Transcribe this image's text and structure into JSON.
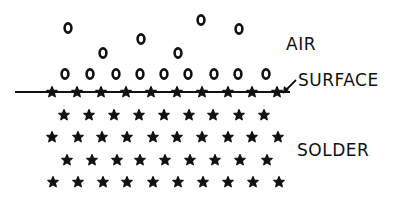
{
  "diagram": {
    "labels": {
      "air": "AIR",
      "surface": "SURFACE",
      "solder": "SOLDER"
    },
    "colors": {
      "ink": "#111111",
      "background": "#ffffff"
    },
    "symbols": {
      "air_molecule": "circle-o",
      "solder_atom": "star"
    },
    "air_scattered": [
      [
        68,
        28
      ],
      [
        103,
        53
      ],
      [
        141,
        39
      ],
      [
        178,
        53
      ],
      [
        201,
        20
      ],
      [
        239,
        29
      ]
    ],
    "air_row": {
      "y": 74,
      "x": [
        65,
        90,
        116,
        140,
        164,
        188,
        214,
        238,
        266
      ]
    },
    "surface_line": {
      "y": 92,
      "x1": 15,
      "x2": 290
    },
    "surface_stars": {
      "y": 92,
      "x": [
        52,
        77,
        101,
        126,
        151,
        177,
        202,
        228,
        252,
        277
      ]
    },
    "solder_rows": [
      {
        "y": 115,
        "x": [
          64,
          89,
          114,
          139,
          164,
          189,
          213,
          239,
          264
        ]
      },
      {
        "y": 137,
        "x": [
          52,
          78,
          102,
          127,
          153,
          177,
          202,
          228,
          252,
          278
        ]
      },
      {
        "y": 160,
        "x": [
          67,
          92,
          117,
          140,
          165,
          190,
          215,
          240,
          267
        ]
      },
      {
        "y": 182,
        "x": [
          53,
          78,
          103,
          127,
          153,
          178,
          203,
          228,
          253,
          279
        ]
      }
    ],
    "surface_arrow": {
      "from": [
        296,
        80
      ],
      "to": [
        283,
        93
      ]
    }
  }
}
